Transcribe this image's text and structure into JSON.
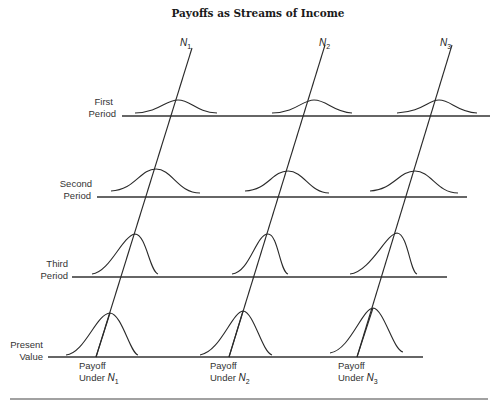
{
  "title": "Payoffs as Streams of Income",
  "streams": [
    {
      "label": "N",
      "sub": "1"
    },
    {
      "label": "N",
      "sub": "2"
    },
    {
      "label": "N",
      "sub": "3"
    }
  ],
  "periods": [
    {
      "line1": "First",
      "line2": "Period"
    },
    {
      "line1": "Second",
      "line2": "Period"
    },
    {
      "line1": "Third",
      "line2": "Period"
    },
    {
      "line1": "Present",
      "line2": "Value"
    }
  ],
  "payoffs": [
    {
      "line1": "Payoff",
      "line2": "Under",
      "n": "N",
      "sub": "1"
    },
    {
      "line1": "Payoff",
      "line2": "Under",
      "n": "N",
      "sub": "2"
    },
    {
      "line1": "Payoff",
      "line2": "Under",
      "n": "N",
      "sub": "3"
    }
  ],
  "colors": {
    "ink": "#2a2a2a",
    "background": "#ffffff"
  }
}
